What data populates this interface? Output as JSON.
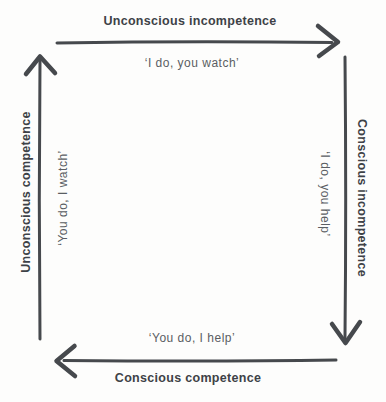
{
  "diagram": {
    "name": "competence-cycle",
    "background": "#fdfdfc",
    "arrow_color": "#46494d",
    "label_color": "#3e4247",
    "quote_color": "#5a5e63",
    "edges": {
      "top": {
        "label": "Unconscious incompetence",
        "quote": "‘I do, you watch’",
        "arrow_direction": "right"
      },
      "right": {
        "label": "Conscious incompetence",
        "quote": "‘I do, you help’",
        "arrow_direction": "down"
      },
      "bottom": {
        "label": "Conscious competence",
        "quote": "‘You do, I help’",
        "arrow_direction": "left"
      },
      "left": {
        "label": "Unconscious competence",
        "quote": "‘You do, I watch’",
        "arrow_direction": "up"
      }
    }
  }
}
